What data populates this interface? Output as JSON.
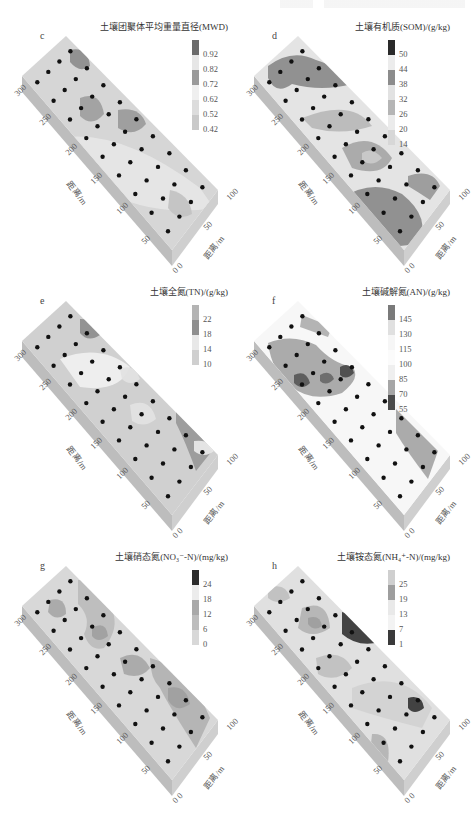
{
  "page": {
    "running_header_visible": true
  },
  "chart_data": [
    {
      "id": "c",
      "type": "heatmap",
      "title": "土壤团聚体平均重量直径(MWD)",
      "panel_label": "c",
      "legend_ticks": [
        "0.92",
        "0.82",
        "0.72",
        "0.62",
        "0.52",
        "0.42"
      ],
      "legend_colors": [
        "#6b6b6b",
        "#e6e6e6",
        "#9a9a9a",
        "#efefef",
        "#dcdcdc",
        "#c9c9c9"
      ],
      "x_axis": {
        "label": "距离/m",
        "ticks": [
          "300",
          "250",
          "200",
          "150",
          "100",
          "50",
          "0"
        ]
      },
      "y_axis": {
        "label": "距离/m",
        "ticks": [
          "0",
          "50",
          "100"
        ]
      },
      "points": 36,
      "grid": false
    },
    {
      "id": "d",
      "type": "heatmap",
      "title": "土壤有机质(SOM)/(g/kg)",
      "panel_label": "d",
      "legend_ticks": [
        "50",
        "44",
        "38",
        "32",
        "26",
        "20",
        "14"
      ],
      "legend_colors": [
        "#2a2a2a",
        "#ececec",
        "#8c8c8c",
        "#e2e2e2",
        "#b5b5b5",
        "#ebebeb",
        "#d7d7d7"
      ],
      "x_axis": {
        "label": "距离/m",
        "ticks": [
          "300",
          "250",
          "200",
          "150",
          "100",
          "50",
          "0"
        ]
      },
      "y_axis": {
        "label": "距离/m",
        "ticks": [
          "0",
          "50",
          "100"
        ]
      },
      "points": 36,
      "grid": false
    },
    {
      "id": "e",
      "type": "heatmap",
      "title": "土壤全氮(TN)/(g/kg)",
      "panel_label": "e",
      "legend_ticks": [
        "22",
        "18",
        "14",
        "10"
      ],
      "legend_colors": [
        "#b4b4b4",
        "#8f8f8f",
        "#e8e8e8",
        "#cfcfcf"
      ],
      "x_axis": {
        "label": "距离/m",
        "ticks": [
          "300",
          "250",
          "200",
          "150",
          "100",
          "50",
          "0"
        ]
      },
      "y_axis": {
        "label": "距离/m",
        "ticks": [
          "0",
          "50",
          "100"
        ]
      },
      "points": 36,
      "grid": false
    },
    {
      "id": "f",
      "type": "heatmap",
      "title": "土壤碱解氮(AN)/(g/kg)",
      "panel_label": "f",
      "legend_ticks": [
        "145",
        "130",
        "115",
        "100",
        "85",
        "70",
        "55"
      ],
      "legend_colors": [
        "#7a7a7a",
        "#e0e0e0",
        "#f6f6f6",
        "#fbfbfb",
        "#efefef",
        "#a6a6a6",
        "#4b4b4b"
      ],
      "x_axis": {
        "label": "距离/m",
        "ticks": [
          "300",
          "250",
          "200",
          "150",
          "100",
          "50",
          "0"
        ]
      },
      "y_axis": {
        "label": "距离/m",
        "ticks": [
          "0",
          "50",
          "100"
        ]
      },
      "points": 36,
      "grid": false
    },
    {
      "id": "g",
      "type": "heatmap",
      "title": "土壤硝态氮(NO₃⁻-N)/(mg/kg)",
      "panel_label": "g",
      "legend_ticks": [
        "24",
        "18",
        "12",
        "6",
        "0"
      ],
      "legend_colors": [
        "#2c2c2c",
        "#ececec",
        "#a9a9a9",
        "#bdbdbd",
        "#d8d8d8"
      ],
      "x_axis": {
        "label": "距离/m",
        "ticks": [
          "300",
          "250",
          "200",
          "150",
          "100",
          "50",
          "0"
        ]
      },
      "y_axis": {
        "label": "距离/m",
        "ticks": [
          "0",
          "50",
          "100"
        ]
      },
      "points": 36,
      "grid": false
    },
    {
      "id": "h",
      "type": "heatmap",
      "title": "土壤铵态氮(NH₄⁺-N)/(mg/kg)",
      "panel_label": "h",
      "legend_ticks": [
        "25",
        "19",
        "13",
        "7",
        "1"
      ],
      "legend_colors": [
        "#cfcfcf",
        "#9e9e9e",
        "#e9e9e9",
        "#f3f3f3",
        "#3a3a3a"
      ],
      "x_axis": {
        "label": "距离/m",
        "ticks": [
          "300",
          "250",
          "200",
          "150",
          "100",
          "50",
          "0"
        ]
      },
      "y_axis": {
        "label": "距离/m",
        "ticks": [
          "0",
          "50",
          "100"
        ]
      },
      "points": 36,
      "grid": false
    }
  ],
  "panels": {
    "c": {
      "title": "土壤团聚体平均重量直径(MWD)",
      "letter": "c",
      "ticks": [
        "0.92",
        "0.82",
        "0.72",
        "0.62",
        "0.52",
        "0.42"
      ],
      "x": [
        "300",
        "250",
        "200",
        "150",
        "100",
        "50"
      ],
      "y": [
        "50",
        "100"
      ],
      "origin": "0 0",
      "xlabel": "距离/m",
      "ylabel": "距离/m"
    },
    "d": {
      "title": "土壤有机质(SOM)/(g/kg)",
      "letter": "d",
      "ticks": [
        "50",
        "44",
        "38",
        "32",
        "26",
        "20",
        "14"
      ],
      "x": [
        "300",
        "250",
        "200",
        "150",
        "100",
        "50"
      ],
      "y": [
        "50",
        "100"
      ],
      "origin": "0 0",
      "xlabel": "距离/m",
      "ylabel": "距离/m"
    },
    "e": {
      "title": "土壤全氮(TN)/(g/kg)",
      "letter": "e",
      "ticks": [
        "22",
        "18",
        "14",
        "10"
      ],
      "x": [
        "300",
        "250",
        "200",
        "150",
        "100",
        "50"
      ],
      "y": [
        "50",
        "100"
      ],
      "origin": "0 0",
      "xlabel": "距离/m",
      "ylabel": "距离/m"
    },
    "f": {
      "title": "土壤碱解氮(AN)/(g/kg)",
      "letter": "f",
      "ticks": [
        "145",
        "130",
        "115",
        "100",
        "85",
        "70",
        "55"
      ],
      "x": [
        "300",
        "250",
        "200",
        "150",
        "100",
        "50"
      ],
      "y": [
        "50",
        "100"
      ],
      "origin": "0 0",
      "xlabel": "距离/m",
      "ylabel": "距离/m"
    },
    "g": {
      "title": "土壤硝态氮(NO₃⁻-N)/(mg/kg)",
      "letter": "g",
      "ticks": [
        "24",
        "18",
        "12",
        "6",
        "0"
      ],
      "x": [
        "300",
        "250",
        "200",
        "150",
        "100",
        "50"
      ],
      "y": [
        "50",
        "100"
      ],
      "origin": "0 0",
      "xlabel": "距离/m",
      "ylabel": "距离/m"
    },
    "h": {
      "title": "土壤铵态氮(NH₄⁺-N)/(mg/kg)",
      "letter": "h",
      "ticks": [
        "25",
        "19",
        "13",
        "7",
        "1"
      ],
      "x": [
        "300",
        "250",
        "200",
        "150",
        "100",
        "50"
      ],
      "y": [
        "50",
        "100"
      ],
      "origin": "0 0",
      "xlabel": "距离/m",
      "ylabel": "距离/m"
    }
  }
}
